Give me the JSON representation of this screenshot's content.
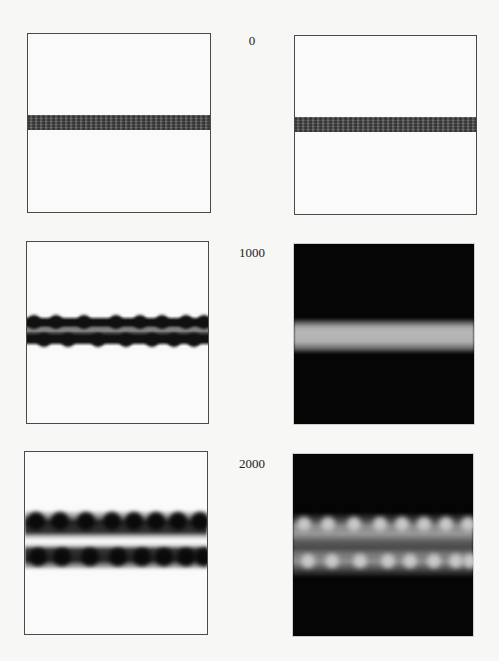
{
  "figure": {
    "rows": [
      {
        "label": "0",
        "left_panel": {
          "style": "light",
          "description": "thin dark speckled band on white"
        },
        "right_panel": {
          "style": "light",
          "description": "thin dark speckled band on white"
        }
      },
      {
        "label": "1000",
        "left_panel": {
          "style": "light",
          "description": "dark band with grey center, bumpy edges"
        },
        "right_panel": {
          "style": "dark",
          "description": "bright grey band on black"
        }
      },
      {
        "label": "2000",
        "left_panel": {
          "style": "light",
          "description": "two rows of dark blobs separated by light gap"
        },
        "right_panel": {
          "style": "dark",
          "description": "two rows of bright blobs with grey middle on black"
        }
      }
    ],
    "colors": {
      "background": "#f7f7f5",
      "panel_border": "#4a4a4a",
      "dark_panel_bg": "#050505",
      "band_grey": "#5a5a5a",
      "bright_band": "#b8b8b8"
    }
  }
}
